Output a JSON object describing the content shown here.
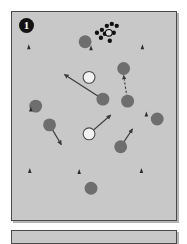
{
  "figure": {
    "background_color": "#ffffff",
    "panels": [
      {
        "id": "panel-1",
        "label": "1",
        "fill_color": "#c8c8c8",
        "border_color": "#4a4a4a",
        "x": 11,
        "y": 11,
        "width": 166,
        "height": 210
      },
      {
        "id": "panel-2",
        "label": "",
        "fill_color": "#c8c8c8",
        "border_color": "#4a4a4a",
        "x": 11,
        "y": 230,
        "width": 166,
        "height": 14
      }
    ]
  },
  "legend_colors": {
    "grey_disc": "#6e6e6e",
    "grey_disc_stroke": "#4c4c4c",
    "open_disc_fill": "#f2f2f2",
    "open_disc_stroke": "#4c4c4c",
    "black_dot": "#101010",
    "triangle": "#2c2c2c",
    "arrow": "#3a3a3a"
  },
  "chart_data": {
    "type": "scatter",
    "title": "",
    "xlabel": "",
    "ylabel": "",
    "xlim": [
      0,
      166
    ],
    "ylim": [
      0,
      210
    ],
    "grid": false,
    "legend_position": "none",
    "annotations": [
      {
        "name": "panel-number",
        "text": "1",
        "x": 14,
        "y": 13
      }
    ],
    "series": [
      {
        "name": "grey filled discs",
        "marker": "circle-filled",
        "color": "#6e6e6e",
        "radius": 6.5,
        "points": [
          {
            "x": 74,
            "y": 30
          },
          {
            "x": 113,
            "y": 57
          },
          {
            "x": 117,
            "y": 90
          },
          {
            "x": 24,
            "y": 95
          },
          {
            "x": 92,
            "y": 88
          },
          {
            "x": 38,
            "y": 114
          },
          {
            "x": 147,
            "y": 108
          },
          {
            "x": 110,
            "y": 136
          },
          {
            "x": 80,
            "y": 178
          }
        ]
      },
      {
        "name": "open white discs",
        "marker": "circle-open",
        "color": "#f2f2f2",
        "stroke": "#4c4c4c",
        "radius": 6.0,
        "points": [
          {
            "x": 78,
            "y": 66
          },
          {
            "x": 78,
            "y": 123
          }
        ]
      },
      {
        "name": "small triangles",
        "marker": "triangle-up",
        "color": "#2c2c2c",
        "size": 5,
        "points": [
          {
            "x": 17,
            "y": 35
          },
          {
            "x": 80,
            "y": 36
          },
          {
            "x": 132,
            "y": 35
          },
          {
            "x": 19,
            "y": 98
          },
          {
            "x": 136,
            "y": 103
          },
          {
            "x": 18,
            "y": 160
          },
          {
            "x": 68,
            "y": 161
          },
          {
            "x": 131,
            "y": 160
          }
        ]
      },
      {
        "name": "black dot cluster",
        "marker": "circle-small-filled",
        "color": "#101010",
        "radius": 2.2,
        "points": [
          {
            "x": 91,
            "y": 18
          },
          {
            "x": 96,
            "y": 14
          },
          {
            "x": 101,
            "y": 12
          },
          {
            "x": 106,
            "y": 14
          },
          {
            "x": 94,
            "y": 22
          },
          {
            "x": 103,
            "y": 21
          },
          {
            "x": 90,
            "y": 26
          },
          {
            "x": 99,
            "y": 29
          },
          {
            "x": 86,
            "y": 21
          }
        ]
      },
      {
        "name": "cluster open marker",
        "marker": "circle-open-small",
        "color": "#d9d9d9",
        "stroke": "#101010",
        "radius": 3.4,
        "points": [
          {
            "x": 98,
            "y": 21
          }
        ]
      }
    ],
    "arrows": [
      {
        "name": "arrow-up-left-long",
        "style": "solid",
        "x1": 92,
        "y1": 88,
        "x2": 53,
        "y2": 63
      },
      {
        "name": "arrow-up-right-from-open",
        "style": "solid",
        "x1": 78,
        "y1": 123,
        "x2": 100,
        "y2": 104
      },
      {
        "name": "arrow-up-right-short",
        "style": "solid",
        "x1": 110,
        "y1": 136,
        "x2": 122,
        "y2": 118
      },
      {
        "name": "arrow-down-right-short",
        "style": "solid",
        "x1": 38,
        "y1": 114,
        "x2": 50,
        "y2": 134
      },
      {
        "name": "arrow-up-dashed",
        "style": "dashed",
        "x1": 117,
        "y1": 90,
        "x2": 113,
        "y2": 64
      }
    ]
  }
}
